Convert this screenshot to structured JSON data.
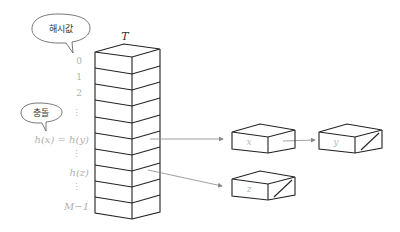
{
  "table": {
    "title": "T",
    "indices": [
      "0",
      "1",
      "2",
      "⋮",
      "h(x) = h(y)",
      "⋮",
      "h(z)",
      "⋮",
      "M−1"
    ],
    "slot_count": 10
  },
  "bubbles": {
    "hash_value": "해시값",
    "collision": "충돌"
  },
  "nodes": [
    {
      "label": "x",
      "terminal": false
    },
    {
      "label": "y",
      "terminal": true
    },
    {
      "label": "z",
      "terminal": true
    }
  ],
  "colors": {
    "stroke": "#222222",
    "arrow": "#888888",
    "faint_text": "#b0b0b0"
  }
}
